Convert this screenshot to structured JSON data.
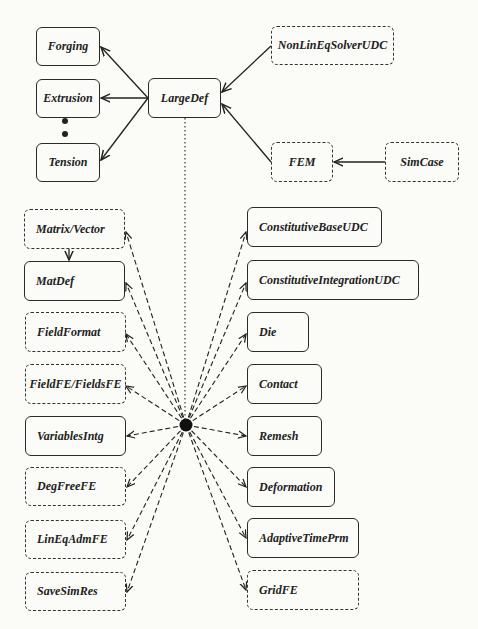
{
  "diagram": {
    "type": "class-dependency-diagram",
    "hub": {
      "label": "",
      "x": 186,
      "y": 425
    },
    "nodes": [
      {
        "id": "forging",
        "label": "Forging",
        "style": "solid",
        "x": 36,
        "y": 27,
        "w": 64,
        "h": 39,
        "align": "center"
      },
      {
        "id": "extrusion",
        "label": "Extrusion",
        "style": "solid",
        "x": 36,
        "y": 79,
        "w": 64,
        "h": 39,
        "align": "center"
      },
      {
        "id": "tension",
        "label": "Tension",
        "style": "solid",
        "x": 36,
        "y": 143,
        "w": 64,
        "h": 39,
        "align": "center"
      },
      {
        "id": "largedef",
        "label": "LargeDef",
        "style": "solid",
        "x": 148,
        "y": 78,
        "w": 73,
        "h": 40,
        "align": "center"
      },
      {
        "id": "nonlineqsolverudc",
        "label": "NonLinEqSolverUDC",
        "style": "dashed",
        "x": 271,
        "y": 26,
        "w": 123,
        "h": 39,
        "align": "center"
      },
      {
        "id": "fem",
        "label": "FEM",
        "style": "dashed",
        "x": 271,
        "y": 142,
        "w": 62,
        "h": 40,
        "align": "center"
      },
      {
        "id": "simcase",
        "label": "SimCase",
        "style": "dashed",
        "x": 385,
        "y": 142,
        "w": 74,
        "h": 40,
        "align": "center"
      },
      {
        "id": "matrixvector",
        "label": "Matrix/Vector",
        "style": "dashed",
        "x": 24,
        "y": 209,
        "w": 101,
        "h": 40,
        "align": "left"
      },
      {
        "id": "matdef",
        "label": "MatDef",
        "style": "solid",
        "x": 24,
        "y": 261,
        "w": 101,
        "h": 40,
        "align": "left"
      },
      {
        "id": "fieldformat",
        "label": "FieldFormat",
        "style": "dashed",
        "x": 25,
        "y": 312,
        "w": 101,
        "h": 40,
        "align": "left"
      },
      {
        "id": "fieldfe",
        "label": "FieldFE/FieldsFE",
        "style": "dashed",
        "x": 25,
        "y": 364,
        "w": 101,
        "h": 40,
        "align": "center"
      },
      {
        "id": "variablesintg",
        "label": "VariablesIntg",
        "style": "solid",
        "x": 25,
        "y": 416,
        "w": 101,
        "h": 40,
        "align": "left"
      },
      {
        "id": "degfreefe",
        "label": "DegFreeFE",
        "style": "dashed",
        "x": 25,
        "y": 467,
        "w": 101,
        "h": 39,
        "align": "left"
      },
      {
        "id": "lineqadmfe",
        "label": "LinEqAdmFE",
        "style": "dashed",
        "x": 25,
        "y": 520,
        "w": 101,
        "h": 39,
        "align": "left"
      },
      {
        "id": "savesimres",
        "label": "SaveSimRes",
        "style": "dashed",
        "x": 25,
        "y": 572,
        "w": 101,
        "h": 39,
        "align": "left"
      },
      {
        "id": "constitutivebaseudc",
        "label": "ConstitutiveBaseUDC",
        "style": "solid",
        "x": 247,
        "y": 207,
        "w": 135,
        "h": 40,
        "align": "left"
      },
      {
        "id": "constitutiveintegrationudc",
        "label": "ConstitutiveIntegrationUDC",
        "style": "solid",
        "x": 247,
        "y": 260,
        "w": 172,
        "h": 40,
        "align": "left"
      },
      {
        "id": "die",
        "label": "Die",
        "style": "solid",
        "x": 247,
        "y": 312,
        "w": 62,
        "h": 40,
        "align": "left"
      },
      {
        "id": "contact",
        "label": "Contact",
        "style": "solid",
        "x": 247,
        "y": 364,
        "w": 75,
        "h": 40,
        "align": "left"
      },
      {
        "id": "remesh",
        "label": "Remesh",
        "style": "solid",
        "x": 247,
        "y": 416,
        "w": 75,
        "h": 40,
        "align": "left"
      },
      {
        "id": "deformation",
        "label": "Deformation",
        "style": "solid",
        "x": 247,
        "y": 467,
        "w": 88,
        "h": 40,
        "align": "left"
      },
      {
        "id": "adaptivetimeprm",
        "label": "AdaptiveTimePrm",
        "style": "solid",
        "x": 247,
        "y": 518,
        "w": 112,
        "h": 40,
        "align": "left"
      },
      {
        "id": "gridfe",
        "label": "GridFE",
        "style": "dashed",
        "x": 247,
        "y": 570,
        "w": 112,
        "h": 40,
        "align": "left"
      }
    ],
    "ellipsis_dots": [
      {
        "x": 65,
        "y": 121
      },
      {
        "x": 65,
        "y": 134
      }
    ],
    "edges": [
      {
        "from": [
          148,
          98
        ],
        "to": [
          101,
          47
        ],
        "style": "solid"
      },
      {
        "from": [
          148,
          98
        ],
        "to": [
          101,
          98
        ],
        "style": "solid"
      },
      {
        "from": [
          148,
          98
        ],
        "to": [
          101,
          160
        ],
        "style": "solid"
      },
      {
        "from": [
          271,
          46
        ],
        "to": [
          222,
          92
        ],
        "style": "solid"
      },
      {
        "from": [
          271,
          162
        ],
        "to": [
          222,
          104
        ],
        "style": "solid"
      },
      {
        "from": [
          385,
          162
        ],
        "to": [
          334,
          162
        ],
        "style": "solid"
      },
      {
        "from": [
          69,
          249
        ],
        "to": [
          69,
          260
        ],
        "style": "solid"
      },
      {
        "from": [
          185,
          118
        ],
        "to": [
          185,
          425
        ],
        "style": "dotted",
        "arrow": false
      },
      {
        "from": [
          186,
          425
        ],
        "to": [
          126,
          232
        ],
        "style": "dashed"
      },
      {
        "from": [
          186,
          425
        ],
        "to": [
          126,
          283
        ],
        "style": "dashed"
      },
      {
        "from": [
          186,
          425
        ],
        "to": [
          126,
          334
        ],
        "style": "dashed"
      },
      {
        "from": [
          186,
          425
        ],
        "to": [
          126,
          386
        ],
        "style": "dashed"
      },
      {
        "from": [
          186,
          425
        ],
        "to": [
          127,
          436
        ],
        "style": "dashed"
      },
      {
        "from": [
          186,
          425
        ],
        "to": [
          127,
          487
        ],
        "style": "dashed"
      },
      {
        "from": [
          186,
          425
        ],
        "to": [
          127,
          540
        ],
        "style": "dashed"
      },
      {
        "from": [
          186,
          425
        ],
        "to": [
          127,
          592
        ],
        "style": "dashed"
      },
      {
        "from": [
          186,
          425
        ],
        "to": [
          246,
          232
        ],
        "style": "dashed"
      },
      {
        "from": [
          186,
          425
        ],
        "to": [
          246,
          283
        ],
        "style": "dashed"
      },
      {
        "from": [
          186,
          425
        ],
        "to": [
          246,
          334
        ],
        "style": "dashed"
      },
      {
        "from": [
          186,
          425
        ],
        "to": [
          246,
          386
        ],
        "style": "dashed"
      },
      {
        "from": [
          186,
          425
        ],
        "to": [
          246,
          436
        ],
        "style": "dashed"
      },
      {
        "from": [
          186,
          425
        ],
        "to": [
          246,
          487
        ],
        "style": "dashed"
      },
      {
        "from": [
          186,
          425
        ],
        "to": [
          246,
          538
        ],
        "style": "dashed"
      },
      {
        "from": [
          186,
          425
        ],
        "to": [
          246,
          590
        ],
        "style": "dashed"
      }
    ]
  }
}
